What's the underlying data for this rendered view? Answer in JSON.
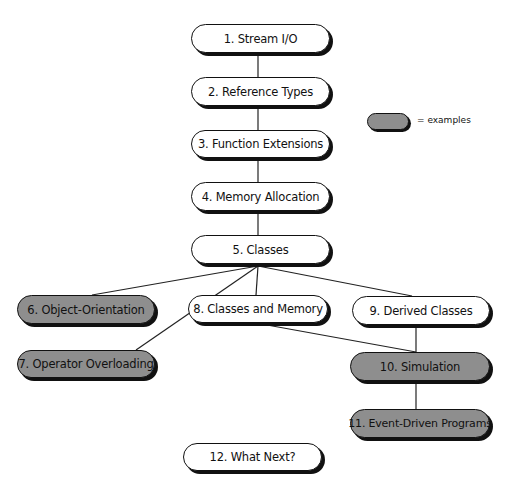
{
  "heading_partial": "...",
  "legend": {
    "swatch_color": "#8e8e8e",
    "label": "= examples"
  },
  "nodes": [
    {
      "id": 1,
      "label": "1. Stream I/O",
      "example": false
    },
    {
      "id": 2,
      "label": "2. Reference Types",
      "example": false
    },
    {
      "id": 3,
      "label": "3. Function Extensions",
      "example": false
    },
    {
      "id": 4,
      "label": "4. Memory Allocation",
      "example": false
    },
    {
      "id": 5,
      "label": "5. Classes",
      "example": false
    },
    {
      "id": 6,
      "label": "6. Object-Orientation",
      "example": true
    },
    {
      "id": 7,
      "label": "7. Operator Overloading",
      "example": true
    },
    {
      "id": 8,
      "label": "8. Classes and Memory",
      "example": false
    },
    {
      "id": 9,
      "label": "9. Derived Classes",
      "example": false
    },
    {
      "id": 10,
      "label": "10. Simulation",
      "example": true
    },
    {
      "id": 11,
      "label": "11. Event-Driven Programs",
      "example": true
    },
    {
      "id": 12,
      "label": "12. What Next?",
      "example": false
    }
  ],
  "edges": [
    [
      "1",
      "2"
    ],
    [
      "2",
      "3"
    ],
    [
      "3",
      "4"
    ],
    [
      "4",
      "5"
    ],
    [
      "5",
      "6"
    ],
    [
      "5",
      "7"
    ],
    [
      "5",
      "8"
    ],
    [
      "5",
      "9"
    ],
    [
      "8",
      "10"
    ],
    [
      "9",
      "10"
    ],
    [
      "10",
      "11"
    ]
  ],
  "colors": {
    "node_fill": "#ffffff",
    "example_fill": "#8e8e8e",
    "outline": "#111111"
  }
}
